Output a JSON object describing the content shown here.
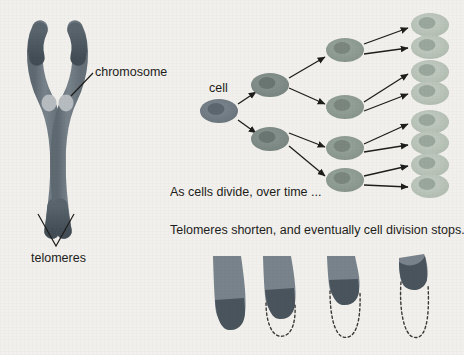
{
  "page": {
    "background_color": "#f2f0ec",
    "text_color": "#1d1d1b",
    "width": 464,
    "height": 355
  },
  "labels": {
    "chromosome": "chromosome",
    "telomeres": "telomeres",
    "cell": "cell",
    "caption_line1": "As cells divide, over time ...",
    "caption_line2": "Telomeres shorten, and eventually cell division stops."
  },
  "colors": {
    "chromosome_arm": "#6f7a84",
    "chromosome_arm_light": "#7f8a93",
    "telomere_tip": "#4a545d",
    "centromere": "#b6bcc0",
    "cell_gen0": "#6f7a84",
    "cell_gen1": "#7d8a86",
    "cell_gen2": "#8d9a92",
    "cell_gen3": "#b8c2b8",
    "nucleus_gen0": "#5b666f",
    "nucleus_gen1": "#6a7672",
    "nucleus_gen2": "#7a867e",
    "nucleus_gen3": "#9aa79c",
    "arrow": "#1d1d1b",
    "dashed_outline": "#3a3a38",
    "leader_line": "#1d1d1b"
  },
  "chromosome_figure": {
    "name": "duplicated-chromosome",
    "description": "X-shaped duplicated chromosome with two sister chromatids, two centromeres and four telomere tips",
    "chromatids": 2,
    "centromere_positions": [
      [
        49,
        103
      ],
      [
        66,
        103
      ]
    ],
    "telomere_tip_count": 4,
    "leader_line": {
      "from": [
        93,
        74
      ],
      "to": [
        72,
        95
      ]
    },
    "telomere_pointer": {
      "apex": [
        55,
        245
      ],
      "left_tip": [
        38,
        213
      ],
      "right_tip": [
        72,
        213
      ]
    }
  },
  "cell_division_tree": {
    "name": "cell-division-binary-tree",
    "generations": 4,
    "cells_per_generation": [
      1,
      2,
      4,
      8
    ],
    "cell_size": {
      "rx": 19,
      "ry": 12
    },
    "nucleus_size": {
      "rx": 8.5,
      "ry": 6
    },
    "generation_fill": [
      "#6f7a84",
      "#7d8a86",
      "#8d9a92",
      "#b8c2b8"
    ],
    "generation_nucleus": [
      "#5b666f",
      "#6a7672",
      "#7a867e",
      "#9aa79c"
    ],
    "nodes": {
      "gen0": [
        [
          219,
          111
        ]
      ],
      "gen1": [
        [
          270,
          85
        ],
        [
          270,
          139
        ]
      ],
      "gen2": [
        [
          345,
          50
        ],
        [
          345,
          107
        ],
        [
          345,
          148
        ],
        [
          345,
          180
        ]
      ],
      "gen3": [
        [
          430,
          25
        ],
        [
          430,
          47
        ],
        [
          430,
          72
        ],
        [
          430,
          93
        ],
        [
          430,
          122
        ],
        [
          430,
          143
        ],
        [
          430,
          165
        ],
        [
          430,
          186
        ]
      ]
    },
    "arrows": [
      {
        "from": [
          238,
          104
        ],
        "to": [
          258,
          91
        ]
      },
      {
        "from": [
          238,
          120
        ],
        "to": [
          258,
          134
        ]
      },
      {
        "from": [
          288,
          78
        ],
        "to": [
          327,
          56
        ]
      },
      {
        "from": [
          288,
          88
        ],
        "to": [
          327,
          104
        ]
      },
      {
        "from": [
          288,
          134
        ],
        "to": [
          327,
          148
        ]
      },
      {
        "from": [
          288,
          146
        ],
        "to": [
          327,
          177
        ]
      },
      {
        "from": [
          364,
          44
        ],
        "to": [
          410,
          28
        ]
      },
      {
        "from": [
          364,
          54
        ],
        "to": [
          410,
          48
        ]
      },
      {
        "from": [
          364,
          102
        ],
        "to": [
          410,
          74
        ]
      },
      {
        "from": [
          364,
          112
        ],
        "to": [
          410,
          94
        ]
      },
      {
        "from": [
          364,
          144
        ],
        "to": [
          410,
          124
        ]
      },
      {
        "from": [
          364,
          153
        ],
        "to": [
          410,
          145
        ]
      },
      {
        "from": [
          364,
          176
        ],
        "to": [
          410,
          166
        ]
      },
      {
        "from": [
          364,
          185
        ],
        "to": [
          410,
          187
        ]
      }
    ]
  },
  "telomere_shortening_figure": {
    "name": "telomere-shortening-sequence",
    "description": "Four chromosome arm tips shown progressively shorter, with dashed outlines marking the lost telomere length",
    "steps": 4,
    "shapes": [
      {
        "index": 1,
        "x": 212,
        "top": 255,
        "bottom": 331,
        "width": 33,
        "telomere_top": 300,
        "dashed": false
      },
      {
        "index": 2,
        "x": 262,
        "top": 255,
        "bottom": 318,
        "width": 33,
        "telomere_top": 290,
        "dashed": true,
        "dashed_bottom": 340
      },
      {
        "index": 3,
        "x": 326,
        "top": 255,
        "bottom": 303,
        "width": 33,
        "telomere_top": 282,
        "dashed": true,
        "dashed_bottom": 341
      },
      {
        "index": 4,
        "x": 398,
        "top": 255,
        "bottom": 287,
        "width": 30,
        "telomere_top": 262,
        "dashed": true,
        "dashed_bottom": 341
      }
    ]
  }
}
